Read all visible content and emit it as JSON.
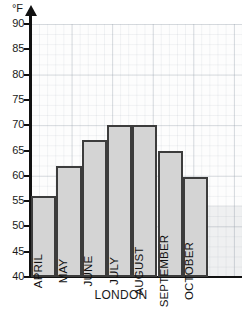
{
  "chart_data": {
    "type": "bar",
    "title": "",
    "xlabel": "LONDON",
    "ylabel": "°F",
    "categories": [
      "APRIL",
      "MAY",
      "JUNE",
      "JULY",
      "AUGUST",
      "SEPTEMBER",
      "OCTOBER"
    ],
    "values": [
      56,
      62,
      67,
      70,
      70,
      65,
      59.7
    ],
    "ylim": [
      40,
      90
    ],
    "ytick_labels": [
      "90",
      "85",
      "80",
      "75",
      "70",
      "65",
      "60",
      "55",
      "50",
      "45",
      "40"
    ],
    "yticks": [
      90,
      85,
      80,
      75,
      70,
      65,
      60,
      55,
      50,
      45,
      40
    ],
    "grid": true,
    "grid_style": "graph-paper",
    "legend": "none",
    "bar_fill": "#d4d4d4",
    "bar_border": "#3c3c3c",
    "axis_color": "#111111"
  },
  "axis": {
    "unit_label": "°F"
  }
}
